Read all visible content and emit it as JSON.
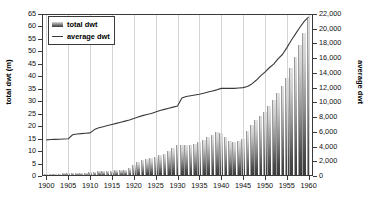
{
  "chart_data": {
    "type": "bar",
    "title": "",
    "subtitle": "",
    "xlabel": "",
    "ylabel": "total dwt (m)",
    "y2label": "average dwt",
    "xlim": [
      1899,
      1961
    ],
    "ylim": [
      0,
      65
    ],
    "y2lim": [
      0,
      22000
    ],
    "grid": "vertical",
    "legend_position": "top-left",
    "y_ticks": [
      0,
      5,
      10,
      15,
      20,
      25,
      30,
      35,
      40,
      45,
      50,
      55,
      60,
      65
    ],
    "y_tick_labels": [
      "0",
      "5",
      "10",
      "15",
      "20",
      "25",
      "30",
      "35",
      "40",
      "45",
      "50",
      "55",
      "60",
      "65"
    ],
    "y2_ticks": [
      0,
      2000,
      4000,
      6000,
      8000,
      10000,
      12000,
      14000,
      16000,
      18000,
      20000,
      22000
    ],
    "y2_tick_labels": [
      "0",
      "2,000",
      "4,000",
      "6,000",
      "8,000",
      "10,000",
      "12,000",
      "14,000",
      "16,000",
      "18,000",
      "20,000",
      "22,000"
    ],
    "x_ticks": [
      1900,
      1905,
      1910,
      1915,
      1920,
      1925,
      1930,
      1935,
      1940,
      1945,
      1950,
      1955,
      1960
    ],
    "x_tick_labels": [
      "1900",
      "1905",
      "1910",
      "1915",
      "1920",
      "1925",
      "1930",
      "1935",
      "1940",
      "1945",
      "1950",
      "1955",
      "1960"
    ],
    "legend": [
      {
        "label": "total dwt",
        "type": "bar",
        "color": "#8a8a8a"
      },
      {
        "label": "average dwt",
        "type": "line",
        "color": "#3a3a3a"
      }
    ],
    "x": [
      1900,
      1901,
      1902,
      1903,
      1904,
      1905,
      1906,
      1907,
      1908,
      1909,
      1910,
      1911,
      1912,
      1913,
      1914,
      1915,
      1916,
      1917,
      1918,
      1919,
      1920,
      1921,
      1922,
      1923,
      1924,
      1925,
      1926,
      1927,
      1928,
      1929,
      1930,
      1931,
      1932,
      1933,
      1934,
      1935,
      1936,
      1937,
      1938,
      1939,
      1940,
      1941,
      1942,
      1943,
      1944,
      1945,
      1946,
      1947,
      1948,
      1949,
      1950,
      1951,
      1952,
      1953,
      1954,
      1955,
      1956,
      1957,
      1958,
      1959,
      1960
    ],
    "series": [
      {
        "name": "total dwt",
        "axis": "left",
        "unit": "m",
        "values": [
          0.9,
          0.9,
          1.0,
          1.0,
          1.1,
          1.1,
          1.2,
          1.3,
          1.3,
          1.4,
          1.5,
          1.7,
          1.9,
          2.1,
          2.2,
          2.2,
          2.3,
          2.4,
          2.6,
          3.2,
          4.4,
          5.6,
          6.4,
          6.8,
          7.2,
          7.8,
          8.3,
          9.0,
          10.0,
          11.2,
          12.4,
          12.5,
          12.3,
          12.4,
          12.8,
          13.5,
          14.3,
          15.5,
          16.6,
          17.6,
          17.2,
          15.6,
          14.2,
          13.6,
          14.0,
          15.0,
          18.0,
          20.6,
          22.4,
          24.0,
          25.8,
          28.2,
          30.6,
          33.2,
          36.0,
          39.5,
          43.5,
          47.8,
          52.5,
          57.5,
          62.8
        ]
      },
      {
        "name": "average dwt",
        "axis": "right",
        "unit": "dwt",
        "values": [
          4900,
          4950,
          4980,
          5000,
          5020,
          5050,
          5600,
          5700,
          5750,
          5800,
          5850,
          6300,
          6550,
          6700,
          6850,
          7000,
          7150,
          7300,
          7450,
          7600,
          7800,
          8000,
          8200,
          8350,
          8500,
          8700,
          8900,
          9050,
          9200,
          9350,
          9500,
          10600,
          10800,
          10900,
          11000,
          11100,
          11250,
          11400,
          11550,
          11700,
          11900,
          11900,
          11900,
          11900,
          11950,
          12000,
          12150,
          12500,
          13000,
          13600,
          14100,
          14700,
          15200,
          15900,
          16500,
          17400,
          18400,
          19300,
          20200,
          21000,
          21600
        ]
      }
    ]
  },
  "axes": {
    "left_title": "total dwt (m)",
    "right_title": "average dwt"
  }
}
